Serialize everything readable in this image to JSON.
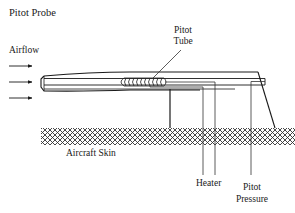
{
  "title": "Pitot Probe",
  "labels": {
    "airflow": "Airflow",
    "pitot_tube_line1": "Pitot",
    "pitot_tube_line2": "Tube",
    "aircraft_skin": "Aircraft Skin",
    "heater": "Heater",
    "pitot_pressure_line1": "Pitot",
    "pitot_pressure_line2": "Pressure"
  },
  "airflow_arrows": 3,
  "colors": {
    "line": "#1a1a1a",
    "thin_line": "#333333",
    "background": "#ffffff"
  }
}
